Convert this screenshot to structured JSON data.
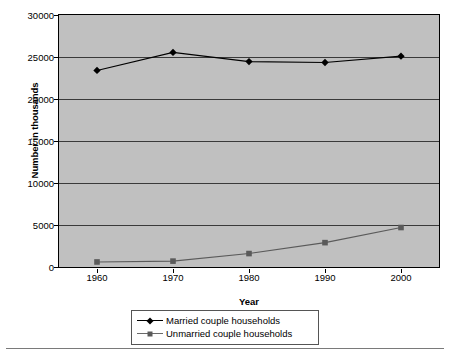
{
  "chart_data": {
    "type": "line",
    "title": "",
    "xlabel": "Year",
    "ylabel": "Number in thousands",
    "categories": [
      "1960",
      "1970",
      "1980",
      "1990",
      "2000"
    ],
    "x": [
      1960,
      1970,
      1980,
      1990,
      2000
    ],
    "xlim": [
      1955,
      2005
    ],
    "ylim": [
      0,
      30000
    ],
    "yticks": [
      "0",
      "5000",
      "10000",
      "15000",
      "20000",
      "25000",
      "30000"
    ],
    "ytick_values": [
      0,
      5000,
      10000,
      15000,
      20000,
      25000,
      30000
    ],
    "grid": true,
    "legend_position": "bottom-center",
    "plot_background": "#c0c0c0",
    "series": [
      {
        "name": "Married couple households",
        "marker": "diamond",
        "color": "#000000",
        "values": [
          23400,
          25550,
          24450,
          24350,
          25100
        ]
      },
      {
        "name": "Unmarried couple households",
        "marker": "square",
        "color": "#5a5a5a",
        "values": [
          600,
          700,
          1600,
          2900,
          4700
        ]
      }
    ]
  },
  "legend": {
    "items": [
      {
        "label": "Married couple households"
      },
      {
        "label": "Unmarried couple households"
      }
    ]
  }
}
